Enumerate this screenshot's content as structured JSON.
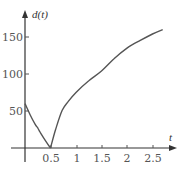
{
  "chart_data": {
    "type": "line",
    "title": "",
    "xlabel": "t",
    "ylabel": "d(t)",
    "xlim": [
      0,
      2.9
    ],
    "ylim": [
      0,
      175
    ],
    "x_ticks": [
      0.5,
      1,
      1.5,
      2,
      2.5
    ],
    "x_tick_labels": [
      "0.5",
      "1",
      "1.5",
      "2",
      "2.5"
    ],
    "y_ticks": [
      50,
      100,
      150
    ],
    "y_tick_labels": [
      "50",
      "100",
      "150"
    ],
    "grid": false,
    "legend": null,
    "series": [
      {
        "name": "d(t)",
        "color": "#555555",
        "x": [
          0,
          0.1,
          0.2,
          0.25,
          0.3,
          0.4,
          0.5,
          0.6,
          0.73,
          0.85,
          1.0,
          1.25,
          1.5,
          1.75,
          2.0,
          2.25,
          2.5,
          2.7
        ],
        "y": [
          60,
          45,
          32,
          27,
          21,
          10,
          0,
          25,
          51,
          63,
          75,
          91,
          104,
          121,
          135,
          145,
          154,
          160
        ]
      }
    ]
  },
  "labels": {
    "y_axis": "d(t)",
    "x_axis": "t",
    "y150": "150",
    "y100": "100",
    "y50": "50",
    "x05": "0.5",
    "x1": "1",
    "x15": "1.5",
    "x2": "2",
    "x25": "2.5"
  }
}
